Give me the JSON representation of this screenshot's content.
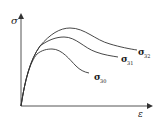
{
  "diagram": {
    "type": "stress-strain curves",
    "y_axis_label": "σ",
    "x_axis_label": "ε",
    "curves": [
      {
        "symbol": "σ",
        "subscript": "30"
      },
      {
        "symbol": "σ",
        "subscript": "31"
      },
      {
        "symbol": "σ",
        "subscript": "32"
      }
    ],
    "colors": {
      "line": "#333333",
      "background": "#ffffff"
    }
  }
}
